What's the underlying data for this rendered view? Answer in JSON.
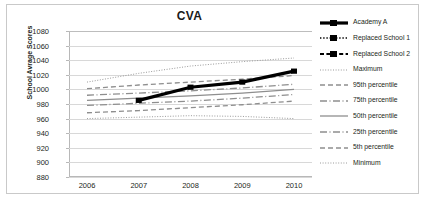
{
  "chart_data": {
    "type": "line",
    "title": "CVA",
    "xlabel": "",
    "ylabel": "School Avrage Scores",
    "categories": [
      "2006",
      "2007",
      "2008",
      "2009",
      "2010"
    ],
    "x": [
      2006,
      2007,
      2008,
      2009,
      2010
    ],
    "ylim": [
      880,
      1080
    ],
    "yticks": [
      1080,
      1060,
      1040,
      1020,
      1000,
      980,
      960,
      940,
      920,
      900,
      880
    ],
    "grid": true,
    "legend_position": "right",
    "series": [
      {
        "name": "Academy A",
        "values": [
          null,
          985,
          1003,
          1010,
          1025
        ],
        "style": "solid-thick-marker",
        "color": "#000000"
      },
      {
        "name": "Replaced School 1",
        "values": [
          null,
          null,
          null,
          null,
          null
        ],
        "style": "dotted-marker",
        "color": "#000000"
      },
      {
        "name": "Replaced School 2",
        "values": [
          null,
          null,
          null,
          null,
          null
        ],
        "style": "dashed-marker",
        "color": "#000000"
      },
      {
        "name": "Maximum",
        "values": [
          1010,
          1022,
          1032,
          1038,
          1043
        ],
        "style": "fine-dotted",
        "color": "#9a9a9a"
      },
      {
        "name": "95th percentile",
        "values": [
          1001,
          1006,
          1010,
          1014,
          1019
        ],
        "style": "dashed",
        "color": "#8e8e8e"
      },
      {
        "name": "75th percentile",
        "values": [
          992,
          995,
          998,
          1002,
          1007
        ],
        "style": "dash-dot",
        "color": "#8e8e8e"
      },
      {
        "name": "50th percentile",
        "values": [
          985,
          988,
          991,
          995,
          1000
        ],
        "style": "solid",
        "color": "#8e8e8e"
      },
      {
        "name": "25th percentile",
        "values": [
          978,
          981,
          984,
          988,
          993
        ],
        "style": "dash-dot",
        "color": "#8e8e8e"
      },
      {
        "name": "5th percentile",
        "values": [
          968,
          971,
          975,
          979,
          984
        ],
        "style": "dashed",
        "color": "#8e8e8e"
      },
      {
        "name": "Minimum",
        "values": [
          960,
          962,
          964,
          963,
          960
        ],
        "style": "fine-dotted",
        "color": "#9a9a9a"
      }
    ]
  },
  "legend": {
    "items": [
      {
        "label": "Academy A"
      },
      {
        "label": "Replaced School 1"
      },
      {
        "label": "Replaced School 2"
      },
      {
        "label": "Maximum"
      },
      {
        "label": "95th percentile"
      },
      {
        "label": "75th  percentile"
      },
      {
        "label": "50th percentile"
      },
      {
        "label": "25th  percentile"
      },
      {
        "label": "5th percentile"
      },
      {
        "label": "Minimum"
      }
    ]
  }
}
